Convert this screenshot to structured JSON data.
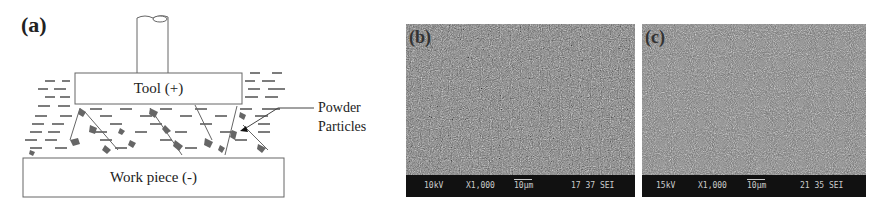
{
  "figure": {
    "panel_a": {
      "label": "(a)",
      "tool_label": "Tool (+)",
      "workpiece_label": "Work piece (-)",
      "annotation_line1": "Powder",
      "annotation_line2": "Particles"
    },
    "panel_b": {
      "label": "(b)",
      "voltage": "10kV",
      "magnification": "X1,000",
      "scale": "10µm",
      "code": "17 37 SEI"
    },
    "panel_c": {
      "label": "(c)",
      "voltage": "15kV",
      "magnification": "X1,000",
      "scale": "10µm",
      "code": "21 35 SEI"
    },
    "colors": {
      "outline": "#555555",
      "particle": "#666666",
      "sem_bg": "#777777",
      "sem_bar": "#111111"
    }
  }
}
